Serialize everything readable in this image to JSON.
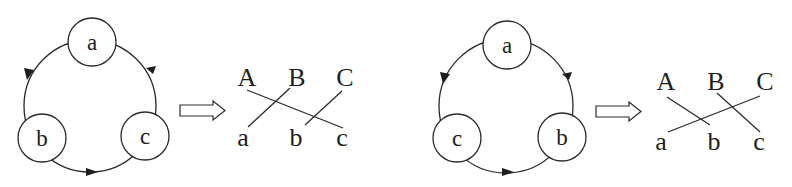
{
  "figure": {
    "panels": [
      {
        "id": "left",
        "cycle": {
          "nodes": [
            {
              "label": "a",
              "position": "top"
            },
            {
              "label": "b",
              "position": "bottom-left"
            },
            {
              "label": "c",
              "position": "bottom-right"
            }
          ],
          "direction": "a → b → c → a"
        },
        "implies_symbol": "⇒",
        "correspondence": {
          "top_labels": [
            "A",
            "B",
            "C"
          ],
          "bottom_labels": [
            "a",
            "b",
            "c"
          ],
          "connections": [
            [
              "A",
              "c"
            ],
            [
              "B",
              "a"
            ],
            [
              "C",
              "b"
            ]
          ]
        }
      },
      {
        "id": "right",
        "cycle": {
          "nodes": [
            {
              "label": "a",
              "position": "top"
            },
            {
              "label": "c",
              "position": "bottom-left"
            },
            {
              "label": "b",
              "position": "bottom-right"
            }
          ],
          "direction": "a → c → b → a"
        },
        "implies_symbol": "⇒",
        "correspondence": {
          "top_labels": [
            "A",
            "B",
            "C"
          ],
          "bottom_labels": [
            "a",
            "b",
            "c"
          ],
          "connections": [
            [
              "A",
              "b"
            ],
            [
              "B",
              "c"
            ],
            [
              "C",
              "a"
            ]
          ]
        }
      }
    ],
    "colors": {
      "ink": "#2a2a2a",
      "background": "#ffffff"
    }
  }
}
